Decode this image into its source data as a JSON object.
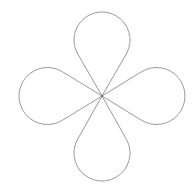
{
  "figure": {
    "title": "Four-petal loop curve",
    "background": "#ffffff",
    "stroke_color": "#9a9a9a",
    "center": {
      "x": 102,
      "y": 96
    },
    "petals": [
      {
        "name": "top",
        "direction": "up",
        "tip": {
          "x": 102,
          "y": 12
        },
        "width": 56
      },
      {
        "name": "right",
        "direction": "right",
        "tip": {
          "x": 185,
          "y": 96
        },
        "width": 57
      },
      {
        "name": "bottom",
        "direction": "down",
        "tip": {
          "x": 102,
          "y": 181
        },
        "width": 56
      },
      {
        "name": "left",
        "direction": "left",
        "tip": {
          "x": 19,
          "y": 96
        },
        "width": 57
      }
    ]
  }
}
